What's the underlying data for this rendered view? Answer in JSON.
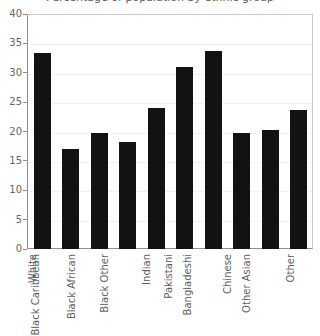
{
  "chart_data": {
    "type": "bar",
    "title": "Percentage of population by ethnic group",
    "xlabel": "",
    "ylabel": "",
    "categories": [
      "White",
      "Black Caribbean",
      "Black African",
      "Black Other",
      "Indian",
      "Pakistani",
      "Bangladeshi",
      "Chinese",
      "Other Asian",
      "Other"
    ],
    "values": [
      33.3,
      17.0,
      19.7,
      18.3,
      24.0,
      31.0,
      33.7,
      19.8,
      20.2,
      23.6
    ],
    "ylim": [
      0,
      40
    ],
    "yticks": [
      0,
      5,
      10,
      15,
      20,
      25,
      30,
      35,
      40
    ],
    "ytick_labels": [
      "0",
      "5",
      "10",
      "15",
      "20",
      "25",
      "30",
      "35",
      "40"
    ],
    "grid": true,
    "legend": "none",
    "bar_color": "#121212"
  }
}
